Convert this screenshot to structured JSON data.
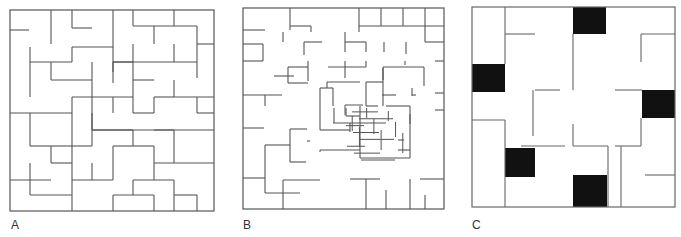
{
  "figure": {
    "panels": [
      {
        "label": "A",
        "description": "Standard maze on a 10x10 grid",
        "bounds": {
          "x": 10,
          "y": 10,
          "w": 204,
          "h": 201
        },
        "stroke": "#555555",
        "walls": [
          [
            10,
            30,
            29,
            30
          ],
          [
            51,
            10,
            51,
            44
          ],
          [
            72,
            10,
            72,
            28
          ],
          [
            72,
            28,
            92,
            28
          ],
          [
            113,
            10,
            113,
            83
          ],
          [
            133,
            10,
            133,
            26
          ],
          [
            133,
            26,
            197,
            26
          ],
          [
            174,
            26,
            174,
            10
          ],
          [
            197,
            26,
            197,
            44
          ],
          [
            197,
            44,
            214,
            44
          ],
          [
            154,
            26,
            154,
            44
          ],
          [
            30,
            47,
            30,
            97
          ],
          [
            30,
            62,
            72,
            62
          ],
          [
            72,
            47,
            72,
            62
          ],
          [
            72,
            47,
            113,
            47
          ],
          [
            51,
            62,
            51,
            80
          ],
          [
            51,
            80,
            92,
            80
          ],
          [
            92,
            62,
            92,
            97
          ],
          [
            113,
            62,
            133,
            62
          ],
          [
            133,
            44,
            133,
            97
          ],
          [
            113,
            72,
            113,
            62
          ],
          [
            133,
            80,
            154,
            80
          ],
          [
            174,
            44,
            174,
            62
          ],
          [
            113,
            62,
            197,
            62
          ],
          [
            197,
            44,
            197,
            78
          ],
          [
            10,
            113,
            72,
            113
          ],
          [
            72,
            97,
            72,
            211
          ],
          [
            72,
            97,
            133,
            97
          ],
          [
            113,
            97,
            113,
            113
          ],
          [
            92,
            97,
            92,
            130
          ],
          [
            92,
            130,
            113,
            130
          ],
          [
            113,
            130,
            133,
            130
          ],
          [
            133,
            113,
            133,
            97
          ],
          [
            154,
            113,
            154,
            97
          ],
          [
            154,
            97,
            174,
            97
          ],
          [
            174,
            97,
            214,
            97
          ],
          [
            174,
            80,
            174,
            97
          ],
          [
            197,
            97,
            197,
            113
          ],
          [
            197,
            113,
            214,
            113
          ],
          [
            154,
            113,
            133,
            113
          ],
          [
            30,
            113,
            30,
            146
          ],
          [
            30,
            146,
            51,
            146
          ],
          [
            51,
            146,
            72,
            146
          ],
          [
            51,
            146,
            51,
            163
          ],
          [
            51,
            163,
            72,
            163
          ],
          [
            92,
            146,
            92,
            113
          ],
          [
            92,
            130,
            174,
            130
          ],
          [
            174,
            130,
            174,
            163
          ],
          [
            154,
            130,
            214,
            130
          ],
          [
            113,
            146,
            133,
            146
          ],
          [
            133,
            130,
            133,
            146
          ],
          [
            72,
            146,
            92,
            146
          ],
          [
            113,
            146,
            113,
            180
          ],
          [
            133,
            146,
            154,
            146
          ],
          [
            154,
            146,
            154,
            180
          ],
          [
            154,
            163,
            214,
            163
          ],
          [
            30,
            163,
            30,
            195
          ],
          [
            10,
            180,
            51,
            180
          ],
          [
            30,
            195,
            72,
            195
          ],
          [
            72,
            180,
            113,
            180
          ],
          [
            92,
            163,
            92,
            180
          ],
          [
            133,
            180,
            174,
            180
          ],
          [
            133,
            180,
            133,
            195
          ],
          [
            174,
            180,
            174,
            211
          ],
          [
            113,
            195,
            154,
            195
          ],
          [
            113,
            195,
            113,
            211
          ],
          [
            154,
            195,
            154,
            211
          ],
          [
            174,
            195,
            197,
            195
          ],
          [
            197,
            195,
            197,
            211
          ]
        ]
      },
      {
        "label": "B",
        "description": "Maze with dense central region and sparse periphery",
        "bounds": {
          "x": 243,
          "y": 8,
          "w": 201,
          "h": 201
        },
        "stroke": "#555555",
        "walls": [
          [
            290,
            8,
            290,
            30
          ],
          [
            243,
            30,
            265,
            30
          ],
          [
            290,
            26,
            311,
            26
          ],
          [
            311,
            26,
            311,
            32
          ],
          [
            359,
            8,
            359,
            32
          ],
          [
            359,
            26,
            444,
            26
          ],
          [
            381,
            8,
            381,
            26
          ],
          [
            403,
            8,
            403,
            26
          ],
          [
            425,
            8,
            425,
            26
          ],
          [
            425,
            26,
            425,
            42
          ],
          [
            425,
            42,
            444,
            42
          ],
          [
            283,
            32,
            283,
            42
          ],
          [
            304,
            42,
            304,
            55
          ],
          [
            304,
            42,
            322,
            42
          ],
          [
            345,
            32,
            345,
            52
          ],
          [
            345,
            42,
            366,
            42
          ],
          [
            366,
            42,
            366,
            52
          ],
          [
            406,
            42,
            406,
            54
          ],
          [
            384,
            42,
            384,
            52
          ],
          [
            243,
            44,
            263,
            44
          ],
          [
            263,
            44,
            263,
            61
          ],
          [
            243,
            61,
            263,
            61
          ],
          [
            288,
            67,
            308,
            67
          ],
          [
            288,
            67,
            288,
            83
          ],
          [
            288,
            83,
            308,
            83
          ],
          [
            308,
            61,
            308,
            81
          ],
          [
            274,
            76,
            294,
            76
          ],
          [
            328,
            67,
            366,
            67
          ],
          [
            345,
            61,
            345,
            78
          ],
          [
            366,
            61,
            366,
            67
          ],
          [
            383,
            67,
            424,
            67
          ],
          [
            383,
            67,
            383,
            80
          ],
          [
            424,
            67,
            424,
            86
          ],
          [
            405,
            61,
            405,
            65
          ],
          [
            435,
            61,
            444,
            61
          ],
          [
            243,
            95,
            282,
            95
          ],
          [
            265,
            95,
            265,
            106
          ],
          [
            327,
            82,
            360,
            82
          ],
          [
            327,
            82,
            327,
            88
          ],
          [
            333,
            88,
            333,
            106
          ],
          [
            320,
            88,
            333,
            88
          ],
          [
            320,
            88,
            320,
            130
          ],
          [
            366,
            82,
            383,
            82
          ],
          [
            366,
            82,
            366,
            106
          ],
          [
            366,
            106,
            378,
            106
          ],
          [
            383,
            68,
            383,
            106
          ],
          [
            382,
            95,
            396,
            95
          ],
          [
            412,
            88,
            412,
            96
          ],
          [
            412,
            95,
            416,
            95
          ],
          [
            435,
            93,
            444,
            93
          ],
          [
            435,
            110,
            444,
            110
          ],
          [
            243,
            128,
            264,
            128
          ],
          [
            264,
            128,
            264,
            128
          ],
          [
            290,
            129,
            307,
            129
          ],
          [
            290,
            129,
            290,
            162
          ],
          [
            290,
            162,
            306,
            162
          ],
          [
            307,
            141,
            310,
            141
          ],
          [
            320,
            130,
            350,
            130
          ],
          [
            334,
            108,
            334,
            123
          ],
          [
            346,
            108,
            346,
            116
          ],
          [
            346,
            116,
            360,
            116
          ],
          [
            333,
            123,
            386,
            123
          ],
          [
            350,
            123,
            350,
            132
          ],
          [
            360,
            106,
            360,
            158
          ],
          [
            360,
            158,
            410,
            158
          ],
          [
            410,
            106,
            410,
            158
          ],
          [
            386,
            106,
            410,
            106
          ],
          [
            398,
            140,
            404,
            140
          ],
          [
            398,
            150,
            410,
            150
          ],
          [
            265,
            145,
            290,
            145
          ],
          [
            265,
            145,
            265,
            193
          ],
          [
            265,
            193,
            300,
            193
          ],
          [
            283,
            180,
            320,
            180
          ],
          [
            283,
            180,
            283,
            209
          ],
          [
            243,
            178,
            265,
            178
          ],
          [
            350,
            179,
            380,
            179
          ],
          [
            366,
            179,
            366,
            209
          ],
          [
            386,
            190,
            386,
            209
          ],
          [
            410,
            179,
            410,
            209
          ],
          [
            420,
            179,
            444,
            179
          ],
          [
            425,
            195,
            425,
            209
          ],
          [
            320,
            150,
            360,
            150
          ],
          [
            320,
            150,
            320,
            152
          ]
        ],
        "center_cluster": {
          "x": 345,
          "y": 105,
          "w": 65,
          "h": 55
        }
      },
      {
        "label": "C",
        "description": "Maze on 6x6 grid with five black filled cells",
        "bounds": {
          "x": 472,
          "y": 7,
          "w": 203,
          "h": 200
        },
        "stroke": "#666666",
        "black_cells": [
          {
            "x": 573,
            "y": 7,
            "w": 33,
            "h": 27
          },
          {
            "x": 472,
            "y": 64,
            "w": 33,
            "h": 28
          },
          {
            "x": 642,
            "y": 90,
            "w": 33,
            "h": 28
          },
          {
            "x": 505,
            "y": 148,
            "w": 30,
            "h": 29
          },
          {
            "x": 573,
            "y": 175,
            "w": 34,
            "h": 32
          }
        ],
        "walls": [
          [
            505,
            7,
            505,
            64
          ],
          [
            505,
            34,
            535,
            34
          ],
          [
            573,
            34,
            573,
            90
          ],
          [
            641,
            34,
            675,
            34
          ],
          [
            641,
            34,
            641,
            62
          ],
          [
            535,
            90,
            560,
            90
          ],
          [
            533,
            90,
            533,
            136
          ],
          [
            615,
            90,
            642,
            90
          ],
          [
            472,
            120,
            505,
            120
          ],
          [
            505,
            120,
            505,
            207
          ],
          [
            573,
            124,
            573,
            146
          ],
          [
            573,
            146,
            608,
            146
          ],
          [
            608,
            146,
            608,
            207
          ],
          [
            615,
            146,
            641,
            146
          ],
          [
            641,
            146,
            641,
            118
          ],
          [
            521,
            146,
            565,
            146
          ],
          [
            621,
            146,
            621,
            207
          ],
          [
            645,
            175,
            675,
            175
          ]
        ]
      }
    ],
    "labels_font_color": "#333333"
  }
}
